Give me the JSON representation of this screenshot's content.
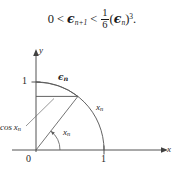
{
  "formula": {
    "lhs": "0",
    "rel1": "<",
    "mid_base": "ϵ",
    "mid_sub": "n+1",
    "rel2": "<",
    "frac_num": "1",
    "frac_den": "6",
    "paren_open": "(",
    "rhs_base": "ϵ",
    "rhs_sub": "n",
    "paren_close": ")",
    "exponent": "3",
    "period": "."
  },
  "figure": {
    "axes": {
      "x_label": "x",
      "y_label": "y",
      "origin_label": "0",
      "x_tick_label": "1",
      "y_tick_label": "1"
    },
    "labels": {
      "epsilon_arc": {
        "base": "ϵ",
        "sub": "n"
      },
      "radius": {
        "base": "x",
        "sub": "n"
      },
      "angle": {
        "base": "x",
        "sub": "n"
      },
      "cosine": {
        "base": "cos x",
        "sub": "n"
      }
    },
    "colors": {
      "stroke": "#4d4d4d",
      "axis": "#404040",
      "text": "#262626",
      "background": "#ffffff"
    },
    "geometry": {
      "origin_px": [
        36,
        110
      ],
      "unit_px": 68,
      "point_angle_deg": 52,
      "arc_radius_unit": 1.0,
      "epsilon_arc_radius_unit": 1.0
    }
  }
}
